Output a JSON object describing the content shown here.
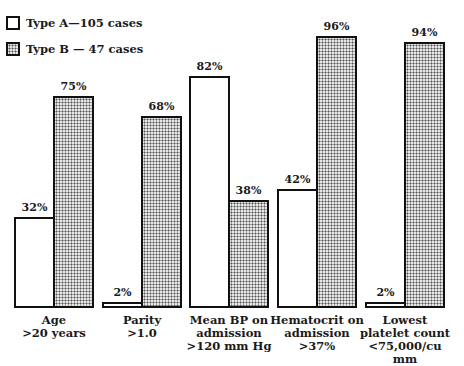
{
  "legend": {
    "items": [
      {
        "label": "Type A—105 cases",
        "style": "plain"
      },
      {
        "label": "Type B — 47 cases",
        "style": "pattern"
      }
    ]
  },
  "chart_data": {
    "type": "bar",
    "title": "",
    "xlabel": "",
    "ylabel": "",
    "ylim": [
      0,
      100
    ],
    "grid": false,
    "legend_position": "top-left",
    "categories": [
      "Age >20 years",
      "Parity >1.0",
      "Mean BP on admission >120 mm Hg",
      "Hematocrit on admission >37%",
      "Lowest platelet count <75,000/cu mm"
    ],
    "series": [
      {
        "name": "Type A—105 cases",
        "values": [
          32,
          2,
          82,
          42,
          2
        ]
      },
      {
        "name": "Type B — 47 cases",
        "values": [
          75,
          68,
          38,
          96,
          94
        ]
      }
    ]
  },
  "groups": [
    {
      "lines": [
        "Age",
        ">20 years"
      ],
      "a_label": "32%",
      "b_label": "75%"
    },
    {
      "lines": [
        "Parity",
        ">1.0"
      ],
      "a_label": "2%",
      "b_label": "68%"
    },
    {
      "lines": [
        "Mean BP on",
        "admission",
        ">120 mm Hg"
      ],
      "a_label": "82%",
      "b_label": "38%"
    },
    {
      "lines": [
        "Hematocrit on",
        "admission",
        ">37%"
      ],
      "a_label": "42%",
      "b_label": "96%"
    },
    {
      "lines": [
        "Lowest",
        "platelet count",
        "<75,000/cu mm"
      ],
      "a_label": "2%",
      "b_label": "94%"
    }
  ]
}
